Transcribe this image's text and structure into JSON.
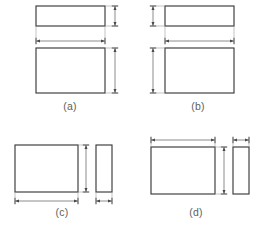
{
  "figure": {
    "background_color": "#ffffff",
    "outline_color": "#3a3a3a",
    "dimension_color": "#6f6f6f",
    "extension_color": "#9a9a9a",
    "label_color": "#5e5e5e",
    "panels": [
      {
        "id": "a",
        "label": "(a)",
        "label_x": 70,
        "label_y": 107,
        "arrangement": "top-view-above-front-view",
        "dimension_side": "right",
        "shapes": [
          {
            "name": "top-view-rectangle",
            "x": 36,
            "y": 6,
            "w": 69,
            "h": 20
          },
          {
            "name": "front-view-rectangle",
            "x": 36,
            "y": 48,
            "w": 69,
            "h": 45
          }
        ],
        "dimensions": [
          {
            "name": "thickness-dimension",
            "orientation": "vertical",
            "x": 115,
            "y1": 6,
            "y2": 26,
            "measures": "top-view-height"
          },
          {
            "name": "width-dimension",
            "orientation": "horizontal",
            "y": 41,
            "x1": 36,
            "x2": 105,
            "measures": "front-view-width"
          },
          {
            "name": "height-dimension",
            "orientation": "vertical",
            "x": 115,
            "y1": 48,
            "y2": 93,
            "measures": "front-view-height"
          }
        ]
      },
      {
        "id": "b",
        "label": "(b)",
        "label_x": 198,
        "label_y": 107,
        "arrangement": "top-view-above-front-view",
        "dimension_side": "left",
        "shapes": [
          {
            "name": "top-view-rectangle",
            "x": 165,
            "y": 6,
            "w": 69,
            "h": 20
          },
          {
            "name": "front-view-rectangle",
            "x": 165,
            "y": 48,
            "w": 69,
            "h": 45
          }
        ],
        "dimensions": [
          {
            "name": "thickness-dimension",
            "orientation": "vertical",
            "x": 153,
            "y1": 6,
            "y2": 26,
            "measures": "top-view-height"
          },
          {
            "name": "width-dimension",
            "orientation": "horizontal",
            "y": 41,
            "x1": 165,
            "x2": 234,
            "measures": "front-view-width"
          },
          {
            "name": "height-dimension",
            "orientation": "vertical",
            "x": 153,
            "y1": 48,
            "y2": 93,
            "measures": "front-view-height"
          }
        ]
      },
      {
        "id": "c",
        "label": "(c)",
        "label_x": 62,
        "label_y": 213,
        "arrangement": "front-view-left-side-view-right",
        "dimension_side": "below",
        "shapes": [
          {
            "name": "front-view-rectangle",
            "x": 15,
            "y": 145,
            "w": 63,
            "h": 47
          },
          {
            "name": "side-view-rectangle",
            "x": 96,
            "y": 145,
            "w": 16,
            "h": 47
          }
        ],
        "dimensions": [
          {
            "name": "height-dimension",
            "orientation": "vertical",
            "x": 86,
            "y1": 145,
            "y2": 192,
            "measures": "front-view-height"
          },
          {
            "name": "width-dimension",
            "orientation": "horizontal",
            "y": 201,
            "x1": 15,
            "x2": 78,
            "measures": "front-view-width"
          },
          {
            "name": "depth-dimension",
            "orientation": "horizontal",
            "y": 201,
            "x1": 96,
            "x2": 112,
            "measures": "side-view-width"
          }
        ]
      },
      {
        "id": "d",
        "label": "(d)",
        "label_x": 196,
        "label_y": 213,
        "arrangement": "front-view-left-side-view-right",
        "dimension_side": "above",
        "shapes": [
          {
            "name": "front-view-rectangle",
            "x": 151,
            "y": 147,
            "w": 64,
            "h": 47
          },
          {
            "name": "side-view-rectangle",
            "x": 233,
            "y": 147,
            "w": 16,
            "h": 47
          }
        ],
        "dimensions": [
          {
            "name": "width-dimension",
            "orientation": "horizontal",
            "y": 140,
            "x1": 151,
            "x2": 215,
            "measures": "front-view-width"
          },
          {
            "name": "depth-dimension",
            "orientation": "horizontal",
            "y": 140,
            "x1": 233,
            "x2": 249,
            "measures": "side-view-width"
          },
          {
            "name": "height-dimension",
            "orientation": "vertical",
            "x": 224,
            "y1": 147,
            "y2": 194,
            "measures": "front-view-height"
          }
        ]
      }
    ]
  }
}
